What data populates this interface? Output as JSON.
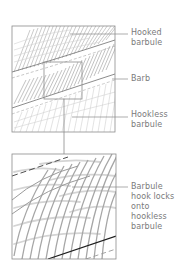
{
  "figure": {
    "colors": {
      "frame": "#8c8c8c",
      "hatch": "#bdbdbd",
      "hatch_dark": "#9a9a9a",
      "leader": "#8a8a8a",
      "label_text": "#7a7a7a",
      "barb_edge": "#2a2a2a"
    }
  },
  "labels": {
    "hooked_barbule": {
      "line1": "Hooked",
      "line2": "barbule"
    },
    "barb": {
      "line1": "Barb"
    },
    "hookless_barbule": {
      "line1": "Hookless",
      "line2": "barbule"
    },
    "hook_locks": {
      "line1": "Barbule",
      "line2": "hook locks",
      "line3": "onto",
      "line4": "hookless",
      "line5": "barbule"
    }
  },
  "panels": [
    {
      "name": "overview",
      "x": 12,
      "y": 26,
      "w": 103,
      "h": 106
    },
    {
      "name": "inset-region",
      "x": 44,
      "y": 62,
      "w": 38,
      "h": 37
    },
    {
      "name": "magnified",
      "x": 12,
      "y": 154,
      "w": 104,
      "h": 105
    }
  ]
}
